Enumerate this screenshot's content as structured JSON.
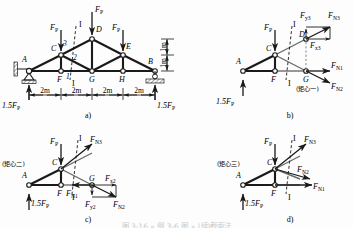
{
  "figure": {
    "type": "engineering-truss-statics-diagram",
    "caption_bottom": "图 3-16  « 例 3-6 图 » (续)截面法",
    "panel_labels": {
      "a": "a)",
      "b": "b)",
      "c": "c)",
      "d": "d)"
    }
  },
  "symbols": {
    "FP": "F",
    "FP_sub": "P",
    "reaction": "1.5F",
    "reaction_sub": "P",
    "FN1": "F",
    "FN1_sub": "N1",
    "FN2": "F",
    "FN2_sub": "N2",
    "FN3": "F",
    "FN3_sub": "N3",
    "Fx2": "F",
    "Fx2_sub": "x2",
    "Fy2": "F",
    "Fy2_sub": "y2",
    "Fx3": "F",
    "Fx3_sub": "x3",
    "Fy3": "F",
    "Fy3_sub": "y3"
  },
  "panel_a": {
    "label": "a)",
    "nodes": [
      "A",
      "C",
      "D",
      "E",
      "B",
      "F",
      "G",
      "H"
    ],
    "member_numbers": [
      "3",
      "2",
      "1"
    ],
    "section_line_label": "I",
    "section_line_label2": "I",
    "loads": [
      {
        "name": "load-at-C",
        "text": "F",
        "sub": "P"
      },
      {
        "name": "load-at-D",
        "text": "F",
        "sub": "P"
      },
      {
        "name": "load-at-E",
        "text": "F",
        "sub": "P"
      }
    ],
    "reaction_left": "1.5F",
    "reaction_left_sub": "P",
    "reaction_right": "1.5F",
    "reaction_right_sub": "P",
    "spans": [
      "2m",
      "2m",
      "2m",
      "2m"
    ],
    "heights": [
      "1m",
      "1m"
    ],
    "supports": [
      "pin-support-A",
      "roller-support-B"
    ]
  },
  "panel_b": {
    "label": "b)",
    "nodes": [
      "A",
      "C",
      "D",
      "F",
      "G"
    ],
    "load": {
      "text": "F",
      "sub": "P"
    },
    "reaction": "1.5F",
    "reaction_sub": "P",
    "section_label_top": "I",
    "section_label_bottom": "I",
    "moment_center_note": "(矩心一)",
    "forces": [
      {
        "name": "FN1",
        "text": "F",
        "sub": "N1"
      },
      {
        "name": "FN2",
        "text": "F",
        "sub": "N2"
      },
      {
        "name": "FN3",
        "text": "F",
        "sub": "N3"
      },
      {
        "name": "Fx3",
        "text": "F",
        "sub": "x3"
      },
      {
        "name": "Fy3",
        "text": "F",
        "sub": "y3"
      }
    ]
  },
  "panel_c": {
    "label": "c)",
    "nodes": [
      "A",
      "C",
      "F",
      "G"
    ],
    "load": {
      "text": "F",
      "sub": "P"
    },
    "reaction": "1.5F",
    "reaction_sub": "P",
    "section_label_top": "I",
    "section_label_bottom": "I",
    "moment_center_note": "(矩心二)",
    "forces": [
      {
        "name": "FN1",
        "text": "F",
        "sub": "N1"
      },
      {
        "name": "FN2",
        "text": "F",
        "sub": "N2"
      },
      {
        "name": "FN3",
        "text": "F",
        "sub": "N3"
      },
      {
        "name": "Fx2",
        "text": "F",
        "sub": "x2"
      },
      {
        "name": "Fy2",
        "text": "F",
        "sub": "y2"
      }
    ]
  },
  "panel_d": {
    "label": "d)",
    "nodes": [
      "A",
      "C",
      "F"
    ],
    "load": {
      "text": "F",
      "sub": "P"
    },
    "reaction": "1.5F",
    "reaction_sub": "P",
    "section_label_top": "I",
    "section_label_bottom": "I",
    "moment_center_note": "(矩心三)",
    "forces": [
      {
        "name": "FN1",
        "text": "F",
        "sub": "N1"
      },
      {
        "name": "FN2",
        "text": "F",
        "sub": "N2"
      },
      {
        "name": "FN3",
        "text": "F",
        "sub": "N3"
      }
    ]
  },
  "colors": {
    "line": "#1a1a1a",
    "thin": "#555555",
    "dashed": "#3a3a3a",
    "hatch": "#4a4a4a",
    "background": "#fdfdfd",
    "caption_faint": "#c9c9c9"
  }
}
